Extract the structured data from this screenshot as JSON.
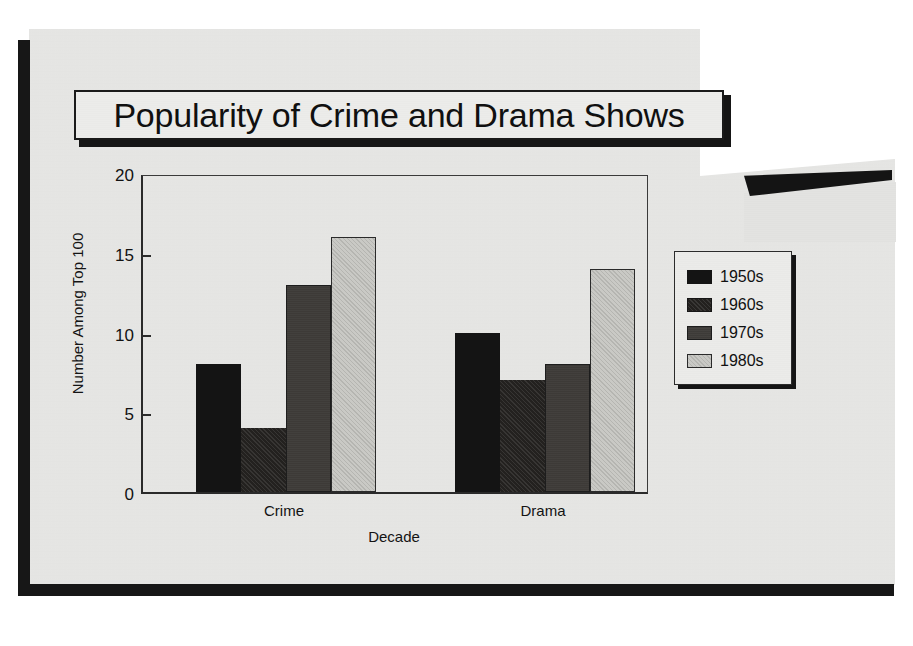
{
  "slide": {
    "title": "Popularity of Crime and Drama Shows"
  },
  "chart_data": {
    "type": "bar",
    "title": "Popularity of Crime and Drama Shows",
    "xlabel": "Decade",
    "ylabel": "Number Among Top 100",
    "categories": [
      "Crime",
      "Drama"
    ],
    "series": [
      {
        "name": "1950s",
        "values": [
          8,
          10
        ],
        "color": "#141414"
      },
      {
        "name": "1960s",
        "values": [
          4,
          7
        ],
        "color": "#23211f"
      },
      {
        "name": "1970s",
        "values": [
          13,
          8
        ],
        "color": "#3a3734"
      },
      {
        "name": "1980s",
        "values": [
          16,
          14
        ],
        "color": "#c9c9c5"
      }
    ],
    "ylim": [
      0,
      20
    ],
    "yticks": [
      0,
      5,
      10,
      15,
      20
    ],
    "ytick_labels": [
      "0",
      "5",
      "10",
      "15",
      "20"
    ],
    "grid": false,
    "legend_position": "right"
  }
}
